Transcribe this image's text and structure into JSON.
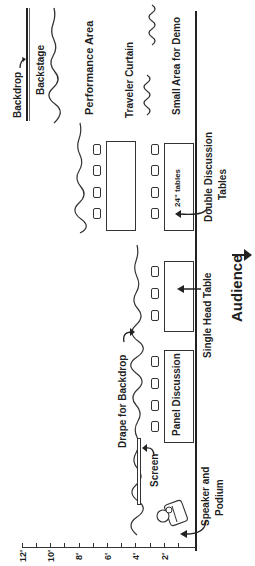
{
  "diagram": {
    "orientation": "rotated-90-ccw",
    "labels": {
      "backdrop": "Backdrop",
      "backstage": "Backstage",
      "performance_area": "Performance Area",
      "traveler_curtain": "Traveler Curtain",
      "small_area_for_demo": "Small Area for Demo",
      "double_discussion_tables_line1": "Double Discussion",
      "double_discussion_tables_line2": "Tables",
      "tables_24": "24\" tables",
      "single_head_table": "Single Head Table",
      "audience": "Audience",
      "drape_for_backdrop": "Drape for Backdrop",
      "panel_discussion": "Panel Discussion",
      "screen": "Screen",
      "speaker_line1": "Speaker and",
      "speaker_line2": "Podium"
    },
    "scale": {
      "unit": "feet",
      "ticks": [
        "12'",
        "10'",
        "8'",
        "6'",
        "4'",
        "2'"
      ]
    },
    "colors": {
      "ink": "#1f1f1f",
      "background": "#ffffff"
    }
  }
}
